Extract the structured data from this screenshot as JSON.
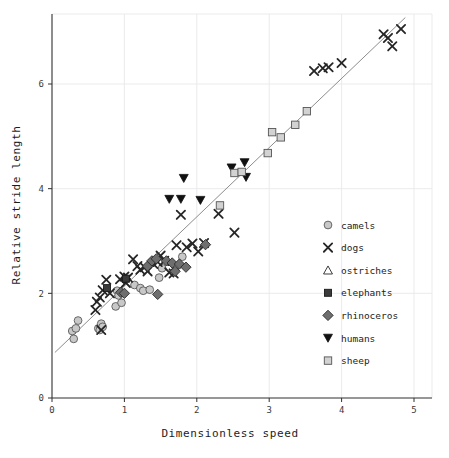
{
  "chart_data": {
    "type": "scatter",
    "title": "",
    "xlabel": "Dimensionless speed",
    "ylabel": "Relative stride length",
    "xlim": [
      0,
      5.2
    ],
    "ylim": [
      0,
      7.35
    ],
    "xticks": [
      0,
      1,
      2,
      3,
      4,
      5
    ],
    "yticks": [
      0,
      2,
      4,
      6
    ],
    "xtick_labels": [
      "0",
      "1",
      "2",
      "3",
      "4",
      "5"
    ],
    "ytick_labels": [
      "0",
      "2",
      "4",
      "6"
    ],
    "grid": true,
    "grid_color": "#e9e9ec",
    "legend_position": "center right",
    "trendline": {
      "name": "linear fit",
      "x": [
        0.04,
        4.88
      ],
      "y": [
        0.87,
        7.27
      ],
      "color": "#8d8d8d"
    },
    "series": [
      {
        "name": "camels",
        "marker": "circle",
        "fill": "#c8c8c8",
        "edge": "#5a5a5a",
        "points": [
          [
            0.28,
            1.28
          ],
          [
            0.33,
            1.33
          ],
          [
            0.36,
            1.48
          ],
          [
            0.3,
            1.13
          ],
          [
            0.64,
            1.33
          ],
          [
            0.68,
            1.42
          ],
          [
            0.66,
            1.3
          ],
          [
            0.7,
            1.36
          ],
          [
            0.9,
            2.05
          ],
          [
            0.92,
            1.96
          ],
          [
            0.88,
            1.75
          ],
          [
            0.96,
            1.82
          ],
          [
            1.14,
            2.16
          ],
          [
            1.22,
            2.1
          ],
          [
            1.26,
            2.05
          ],
          [
            1.35,
            2.07
          ],
          [
            1.48,
            2.3
          ],
          [
            1.52,
            2.48
          ],
          [
            1.8,
            2.7
          ]
        ]
      },
      {
        "name": "dogs",
        "marker": "x",
        "fill": "#262626",
        "edge": "#262626",
        "points": [
          [
            0.6,
            1.68
          ],
          [
            0.62,
            1.84
          ],
          [
            0.66,
            1.92
          ],
          [
            0.7,
            2.06
          ],
          [
            0.68,
            1.3
          ],
          [
            0.75,
            2.26
          ],
          [
            0.8,
            2.0
          ],
          [
            0.94,
            2.27
          ],
          [
            1.0,
            2.32
          ],
          [
            1.02,
            2.2
          ],
          [
            1.05,
            2.3
          ],
          [
            1.12,
            2.65
          ],
          [
            1.18,
            2.52
          ],
          [
            1.22,
            2.45
          ],
          [
            1.28,
            2.5
          ],
          [
            1.32,
            2.42
          ],
          [
            1.4,
            2.56
          ],
          [
            1.46,
            2.6
          ],
          [
            1.5,
            2.72
          ],
          [
            1.55,
            2.62
          ],
          [
            1.62,
            2.4
          ],
          [
            1.68,
            2.38
          ],
          [
            1.72,
            2.92
          ],
          [
            1.78,
            3.5
          ],
          [
            1.86,
            2.88
          ],
          [
            1.94,
            2.95
          ],
          [
            2.02,
            2.8
          ],
          [
            2.1,
            2.96
          ],
          [
            2.3,
            3.52
          ],
          [
            2.52,
            3.16
          ],
          [
            3.62,
            6.25
          ],
          [
            3.74,
            6.3
          ],
          [
            3.82,
            6.32
          ],
          [
            4.0,
            6.4
          ],
          [
            4.58,
            6.95
          ],
          [
            4.64,
            6.88
          ],
          [
            4.7,
            6.72
          ],
          [
            4.82,
            7.05
          ]
        ]
      },
      {
        "name": "ostriches",
        "marker": "triangle-up",
        "fill": "#ffffff",
        "edge": "#262626",
        "points": []
      },
      {
        "name": "elephants",
        "marker": "square",
        "fill": "#3a3a3a",
        "edge": "#1a1a1a",
        "points": [
          [
            0.76,
            2.1
          ],
          [
            1.02,
            2.28
          ]
        ]
      },
      {
        "name": "rhinoceros",
        "marker": "diamond",
        "fill": "#6e6e6e",
        "edge": "#2a2a2a",
        "points": [
          [
            0.95,
            2.02
          ],
          [
            1.0,
            2.0
          ],
          [
            1.32,
            2.52
          ],
          [
            1.38,
            2.62
          ],
          [
            1.44,
            2.66
          ],
          [
            1.46,
            1.98
          ],
          [
            1.58,
            2.62
          ],
          [
            1.66,
            2.58
          ],
          [
            1.7,
            2.42
          ],
          [
            1.76,
            2.56
          ],
          [
            1.85,
            2.5
          ],
          [
            2.12,
            2.93
          ]
        ]
      },
      {
        "name": "humans",
        "marker": "triangle-down",
        "fill": "#111111",
        "edge": "#111111",
        "points": [
          [
            1.62,
            3.8
          ],
          [
            1.78,
            3.8
          ],
          [
            1.82,
            4.2
          ],
          [
            2.05,
            3.78
          ],
          [
            2.48,
            4.4
          ],
          [
            2.66,
            4.5
          ],
          [
            2.68,
            4.22
          ]
        ]
      },
      {
        "name": "sheep",
        "marker": "square",
        "fill": "#d2d2d2",
        "edge": "#555555",
        "points": [
          [
            2.32,
            3.68
          ],
          [
            2.52,
            4.3
          ],
          [
            2.62,
            4.32
          ],
          [
            2.98,
            4.68
          ],
          [
            3.04,
            5.08
          ],
          [
            3.16,
            4.98
          ],
          [
            3.36,
            5.22
          ],
          [
            3.52,
            5.48
          ]
        ]
      }
    ]
  },
  "legend": {
    "items": [
      {
        "label": "camels"
      },
      {
        "label": "dogs"
      },
      {
        "label": "ostriches"
      },
      {
        "label": "elephants"
      },
      {
        "label": "rhinoceros"
      },
      {
        "label": "humans"
      },
      {
        "label": "sheep"
      }
    ]
  },
  "axes": {
    "x_title": "Dimensionless speed",
    "y_title": "Relative stride length"
  }
}
